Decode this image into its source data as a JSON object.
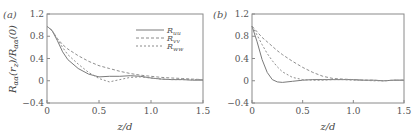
{
  "chart_data": [
    {
      "type": "line",
      "panel_label": "(a)",
      "title": "",
      "xlabel": "z/d",
      "ylabel": "R_αα(r_z)/R_αα(0)",
      "xlim": [
        0,
        1.5
      ],
      "ylim": [
        -0.4,
        1.2
      ],
      "xticks": [
        "0",
        "0.5",
        "1.0",
        "1.5"
      ],
      "yticks": [
        "-0.4",
        "0",
        "0.4",
        "0.8",
        "1.2"
      ],
      "grid": false,
      "legend_position": "upper right",
      "x": [
        0,
        0.05,
        0.1,
        0.15,
        0.2,
        0.3,
        0.4,
        0.5,
        0.6,
        0.7,
        0.8,
        0.9,
        1.0,
        1.1,
        1.2,
        1.3,
        1.4,
        1.5
      ],
      "series": [
        {
          "name": "R_uu",
          "style": "solid",
          "values": [
            0.98,
            0.9,
            0.72,
            0.52,
            0.38,
            0.22,
            0.12,
            0.07,
            0.08,
            0.08,
            0.09,
            0.08,
            0.05,
            0.03,
            0.02,
            0.02,
            0.01,
            0.01
          ]
        },
        {
          "name": "R_vv",
          "style": "dashed",
          "values": [
            0.98,
            0.9,
            0.76,
            0.65,
            0.57,
            0.45,
            0.35,
            0.27,
            0.22,
            0.17,
            0.13,
            0.1,
            0.08,
            0.06,
            0.05,
            0.04,
            0.03,
            0.02
          ]
        },
        {
          "name": "R_ww",
          "style": "dashed",
          "values": [
            0.98,
            0.9,
            0.74,
            0.6,
            0.47,
            0.3,
            0.15,
            0.04,
            -0.02,
            0.02,
            0.06,
            0.07,
            0.05,
            0.03,
            0.02,
            0.02,
            0.02,
            0.02
          ]
        }
      ]
    },
    {
      "type": "line",
      "panel_label": "(b)",
      "title": "",
      "xlabel": "z/d",
      "ylabel": "",
      "xlim": [
        0,
        1.5
      ],
      "ylim": [
        -0.4,
        1.2
      ],
      "xticks": [
        "0",
        "0.5",
        "1.0",
        "1.5"
      ],
      "yticks": [
        "-0.4",
        "0",
        "0.4",
        "0.8",
        "1.2"
      ],
      "grid": false,
      "x": [
        0,
        0.05,
        0.1,
        0.15,
        0.2,
        0.25,
        0.3,
        0.4,
        0.5,
        0.6,
        0.7,
        0.8,
        0.9,
        1.0,
        1.1,
        1.2,
        1.3,
        1.4,
        1.5
      ],
      "series": [
        {
          "name": "R_uu",
          "style": "solid",
          "values": [
            0.98,
            0.7,
            0.38,
            0.15,
            0.02,
            -0.02,
            -0.03,
            -0.01,
            0.01,
            0.02,
            0.02,
            0.02,
            0.02,
            0.02,
            0.01,
            0.01,
            0.0,
            0.01,
            0.01
          ]
        },
        {
          "name": "R_vv",
          "style": "dashed",
          "values": [
            0.98,
            0.88,
            0.78,
            0.7,
            0.62,
            0.54,
            0.47,
            0.35,
            0.24,
            0.15,
            0.08,
            0.04,
            0.03,
            0.02,
            0.01,
            0.01,
            0.0,
            0.01,
            0.01
          ]
        },
        {
          "name": "R_ww",
          "style": "dashed",
          "values": [
            0.98,
            0.82,
            0.65,
            0.49,
            0.36,
            0.25,
            0.16,
            0.06,
            0.02,
            0.01,
            0.01,
            0.02,
            0.02,
            0.01,
            0.01,
            0.0,
            0.0,
            0.01,
            0.01
          ]
        }
      ]
    }
  ],
  "panels": {
    "a": {
      "label": "(a)",
      "ylabel_main": "R",
      "ylabel_text": "R_αα(r_z)/R_αα(0)",
      "xlabel": "z/d"
    },
    "b": {
      "label": "(b)",
      "xlabel": "z/d"
    }
  },
  "legend": [
    {
      "base": "R",
      "sub": "uu"
    },
    {
      "base": "R",
      "sub": "vv"
    },
    {
      "base": "R",
      "sub": "ww"
    }
  ],
  "axis": {
    "yticks": [
      "1.2",
      "0.8",
      "0.4",
      "0",
      "−0.4"
    ],
    "xticks": [
      "0",
      "0.5",
      "1.0",
      "1.5"
    ]
  },
  "colors": {
    "axis": "#888888",
    "line": "#8a8a8a",
    "text": "#555555"
  }
}
